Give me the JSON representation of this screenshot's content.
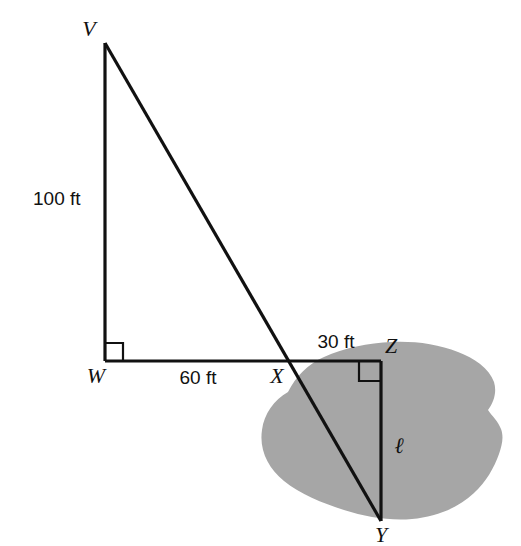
{
  "figure": {
    "type": "geometry-diagram",
    "background_color": "#ffffff",
    "line_color": "#111111",
    "pond_color": "#a6a6a6"
  },
  "vertices": [
    {
      "id": "V",
      "label": "V",
      "x": 105,
      "y": 43,
      "label_x": 89,
      "label_y": 36
    },
    {
      "id": "W",
      "label": "W",
      "x": 105,
      "y": 361,
      "label_x": 96,
      "label_y": 383
    },
    {
      "id": "X",
      "label": "X",
      "x": 288,
      "y": 361,
      "label_x": 277,
      "label_y": 383
    },
    {
      "id": "Z",
      "label": "Z",
      "x": 381,
      "y": 361,
      "label_x": 391,
      "label_y": 353
    },
    {
      "id": "Y",
      "label": "Y",
      "x": 381,
      "y": 521,
      "label_x": 381,
      "label_y": 542
    }
  ],
  "segments": [
    {
      "id": "VW",
      "from": "V",
      "to": "W",
      "name": "vertical-leg-vw"
    },
    {
      "id": "WZ",
      "from": "W",
      "to": "Z",
      "name": "horizontal-baseline-wz"
    },
    {
      "id": "VY",
      "from": "V",
      "to": "Y",
      "name": "transversal-vy"
    },
    {
      "id": "ZY",
      "from": "Z",
      "to": "Y",
      "name": "vertical-leg-zy"
    }
  ],
  "measurements": [
    {
      "id": "vw-length",
      "text": "100 ft",
      "x": 33,
      "y": 205,
      "anchor": "start"
    },
    {
      "id": "wx-length",
      "text": "60 ft",
      "x": 198,
      "y": 384,
      "anchor": "middle"
    },
    {
      "id": "xz-length",
      "text": "30 ft",
      "x": 336,
      "y": 348,
      "anchor": "middle"
    },
    {
      "id": "zy-length",
      "text": "ℓ",
      "x": 399,
      "y": 453,
      "anchor": "middle"
    }
  ],
  "right_angles": [
    {
      "id": "angle-w",
      "at": "W",
      "label": "right-angle-at-w"
    },
    {
      "id": "angle-z",
      "at": "Z",
      "label": "right-angle-at-z"
    }
  ],
  "pond": {
    "name": "pond-region",
    "fill": "#a6a6a6",
    "path": "M 288 392 C 272 404 262 424 266 444 C 270 466 288 482 312 492 C 334 501 358 510 382 516 C 404 521 428 520 448 512 C 466 505 480 492 489 477 C 496 465 500 452 503 440 C 506 428 505 416 498 406 C 490 394 476 386 462 380 C 444 372 424 368 404 367 C 384 366 364 369 346 374 C 328 379 308 382 288 392 Z"
  }
}
